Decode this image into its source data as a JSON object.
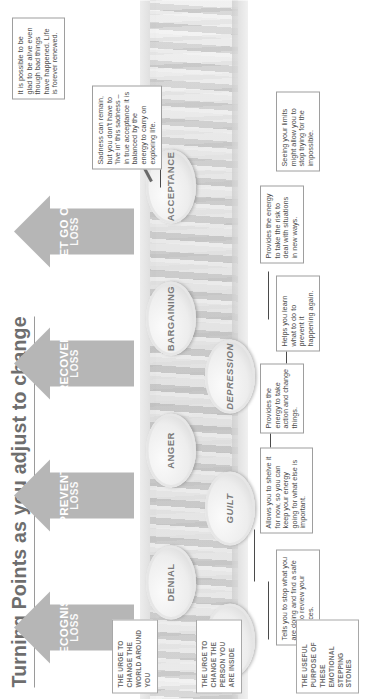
{
  "title": "Turning Points as you adjust to change",
  "arrows": [
    {
      "label": "RECOGNISE",
      "sub": "LOSS"
    },
    {
      "label": "PREVENT",
      "sub": "LOSS"
    },
    {
      "label": "RECOVER",
      "sub": "LOSS"
    },
    {
      "label": "LET GO OF",
      "sub": "LOSS"
    }
  ],
  "stones_upper": [
    {
      "label": "DENIAL"
    },
    {
      "label": "ANGER"
    },
    {
      "label": "BARGAINING"
    },
    {
      "label": "ACCEPTANCE"
    }
  ],
  "stones_lower": [
    {
      "label": "SHOCK"
    },
    {
      "label": "GUILT"
    },
    {
      "label": "DEPRESSION"
    }
  ],
  "callouts": [
    {
      "stage": "shock",
      "text": "Tells you to stop what you are doing and find a safe place to review your resources."
    },
    {
      "stage": "denial",
      "text": "Allows you to shelve it for now, so you can keep your energy going for what else is important."
    },
    {
      "stage": "anger",
      "text": "Provides the energy to take action and change things."
    },
    {
      "stage": "guilt",
      "text": "Helps you learn what to do to prevent it happening again."
    },
    {
      "stage": "bargaining",
      "text": "Provides the energy to take the risk to deal with situations in new ways."
    },
    {
      "stage": "depression",
      "text": "Seeing your limits might allow you to stop trying for the impossible."
    },
    {
      "stage": "acceptance",
      "text": "Sadness can remain, but you don't have to 'live in' this sadness – in true acceptance it is balanced by the energy to carry on exploring life."
    },
    {
      "stage": "acceptance-renewal",
      "text": "It is possible to be glad to be alive even though bad things have happened. Life is forever renewed."
    }
  ],
  "legends": [
    {
      "text": "THE URGE TO CHANGE THE WORLD AROUND YOU"
    },
    {
      "text": "THE URGE TO CHANGE THE PERSON YOU ARE INSIDE"
    },
    {
      "text": "THE USEFUL PURPOSE OF THESE EMOTIONAL STEPPING STONES"
    }
  ],
  "colors": {
    "arrow": "#b6b6b6",
    "title": "#6e6e6e",
    "stone_text": "#7a7a7a",
    "callout_border": "#9e9e9e",
    "callout_text": "#4a4a4a"
  }
}
